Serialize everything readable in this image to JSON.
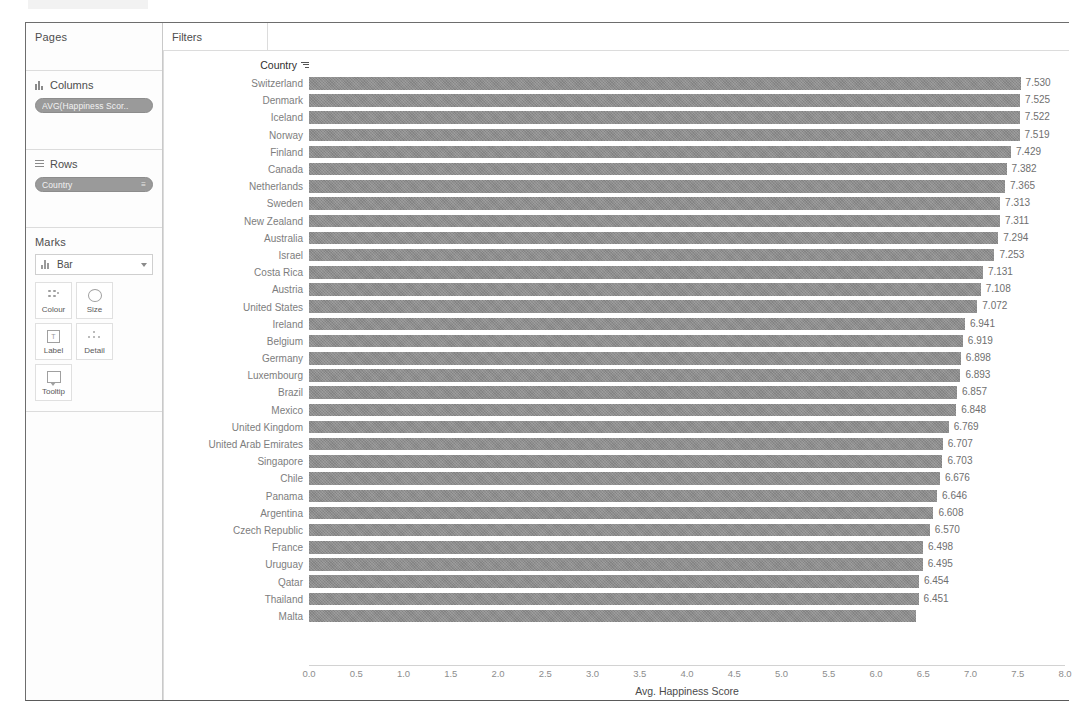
{
  "window": {
    "shelf": {
      "pages": {
        "title": "Pages"
      },
      "columns": {
        "title": "Columns",
        "pill": "AVG(Happiness Scor..",
        "pill_icon": "continuous-pill-icon"
      },
      "rows": {
        "title": "Rows",
        "pill": "Country",
        "pill_icon": "sort-icon"
      },
      "marks": {
        "title": "Marks",
        "mark_type": "Bar",
        "buttons": [
          {
            "label": "Colour",
            "icon": "colour-icon"
          },
          {
            "label": "Size",
            "icon": "size-icon"
          },
          {
            "label": "Label",
            "icon": "label-icon"
          },
          {
            "label": "Detail",
            "icon": "detail-icon"
          },
          {
            "label": "Tooltip",
            "icon": "tooltip-icon"
          }
        ]
      }
    },
    "viz": {
      "filters_label": "Filters",
      "column_header": "Country"
    }
  },
  "chart_data": {
    "type": "bar",
    "orientation": "horizontal",
    "title": "",
    "xlabel": "Avg. Happiness Score",
    "ylabel": "Country",
    "xlim": [
      0,
      8
    ],
    "xticks": [
      "0.0",
      "0.5",
      "1.0",
      "1.5",
      "2.0",
      "2.5",
      "3.0",
      "3.5",
      "4.0",
      "4.5",
      "5.0",
      "5.5",
      "6.0",
      "6.5",
      "7.0",
      "7.5",
      "8.0"
    ],
    "xtick_values": [
      0,
      0.5,
      1,
      1.5,
      2,
      2.5,
      3,
      3.5,
      4,
      4.5,
      5,
      5.5,
      6,
      6.5,
      7,
      7.5,
      8
    ],
    "grid": false,
    "legend": "none",
    "sorted": "descending",
    "bar_color": "#8d8d8d",
    "categories": [
      "Switzerland",
      "Denmark",
      "Iceland",
      "Norway",
      "Finland",
      "Canada",
      "Netherlands",
      "Sweden",
      "New Zealand",
      "Australia",
      "Israel",
      "Costa Rica",
      "Austria",
      "United States",
      "Ireland",
      "Belgium",
      "Germany",
      "Luxembourg",
      "Brazil",
      "Mexico",
      "United Kingdom",
      "United Arab Emirates",
      "Singapore",
      "Chile",
      "Panama",
      "Argentina",
      "Czech Republic",
      "France",
      "Uruguay",
      "Qatar",
      "Thailand",
      "Malta"
    ],
    "values": [
      7.53,
      7.525,
      7.522,
      7.519,
      7.429,
      7.382,
      7.365,
      7.313,
      7.311,
      7.294,
      7.253,
      7.131,
      7.108,
      7.072,
      6.941,
      6.919,
      6.898,
      6.893,
      6.857,
      6.848,
      6.769,
      6.707,
      6.703,
      6.676,
      6.646,
      6.608,
      6.57,
      6.498,
      6.495,
      6.454,
      6.451,
      6.424
    ],
    "value_labels": [
      "7.530",
      "7.525",
      "7.522",
      "7.519",
      "7.429",
      "7.382",
      "7.365",
      "7.313",
      "7.311",
      "7.294",
      "7.253",
      "7.131",
      "7.108",
      "7.072",
      "6.941",
      "6.919",
      "6.898",
      "6.893",
      "6.857",
      "6.848",
      "6.769",
      "6.707",
      "6.703",
      "6.676",
      "6.646",
      "6.608",
      "6.570",
      "6.498",
      "6.495",
      "6.454",
      "6.451",
      ""
    ],
    "clipped_last_row": true
  }
}
